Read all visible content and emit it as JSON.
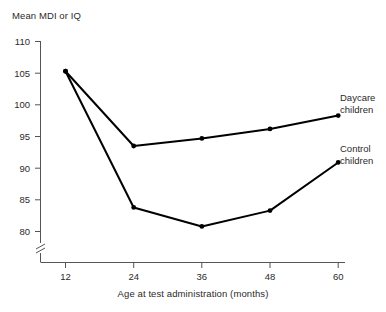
{
  "chart_data": {
    "type": "line",
    "title": "",
    "xlabel": "Age at test administration (months)",
    "ylabel": "Mean MDI or IQ",
    "x": [
      12,
      24,
      36,
      48,
      60
    ],
    "xticklabels": [
      "12",
      "24",
      "36",
      "48",
      "60"
    ],
    "yticks": [
      80,
      85,
      90,
      95,
      100,
      105,
      110
    ],
    "yticklabels": [
      "80",
      "85",
      "90",
      "95",
      "100",
      "105",
      "110"
    ],
    "xlim": [
      12,
      60
    ],
    "ylim": [
      80,
      110
    ],
    "axis_break": true,
    "grid": false,
    "legend_position": "right-inline",
    "series": [
      {
        "name": "Daycare children",
        "label_line1": "Daycare",
        "label_line2": "children",
        "color": "#000000",
        "values": [
          105.3,
          93.5,
          94.7,
          96.2,
          98.3
        ]
      },
      {
        "name": "Control children",
        "label_line1": "Control",
        "label_line2": "children",
        "color": "#000000",
        "values": [
          105.3,
          83.8,
          80.8,
          83.3,
          90.9
        ]
      }
    ]
  },
  "colors": {
    "background": "#ffffff",
    "axis": "#555555",
    "line": "#111111",
    "text": "#2b2b2b"
  }
}
